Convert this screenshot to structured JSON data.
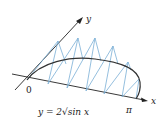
{
  "figure": {
    "axis_labels": {
      "x": "x",
      "y": "y"
    },
    "origin_label": "0",
    "pi_label": "π",
    "equation_label": "y = 2√sin x",
    "colors": {
      "axes": "#222222",
      "curve": "#333333",
      "triangles": "#7aaed6"
    },
    "triangles": [
      {
        "b1": [
          27,
          80
        ],
        "b2": [
          48,
          84
        ],
        "apex": [
          58,
          41
        ],
        "top": [
          33,
          72
        ]
      },
      {
        "b1": [
          48,
          84
        ],
        "b2": [
          67,
          88
        ],
        "apex": [
          78,
          38
        ],
        "top": [
          58,
          63
        ]
      },
      {
        "b1": [
          67,
          88
        ],
        "b2": [
          86,
          91
        ],
        "apex": [
          95,
          38
        ],
        "top": [
          80,
          60
        ]
      },
      {
        "b1": [
          86,
          91
        ],
        "b2": [
          104,
          94
        ],
        "apex": [
          113,
          46
        ],
        "top": [
          103,
          62
        ]
      },
      {
        "b1": [
          104,
          94
        ],
        "b2": [
          122,
          97
        ],
        "apex": [
          128,
          62
        ],
        "top": [
          124,
          68
        ]
      },
      {
        "b1": [
          122,
          97
        ],
        "b2": [
          136,
          99
        ],
        "apex": [
          140,
          80
        ],
        "top": [
          139,
          82
        ]
      }
    ]
  }
}
